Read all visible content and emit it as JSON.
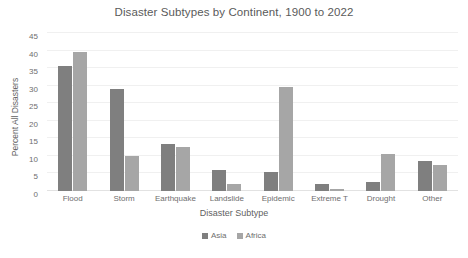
{
  "chart_data": {
    "type": "bar",
    "title": "Disaster Subtypes by Continent, 1900 to 2022",
    "xlabel": "Disaster Subtype",
    "ylabel": "Percent All Disasters",
    "categories": [
      "Flood",
      "Storm",
      "Earthquake",
      "Landslide",
      "Epidemic",
      "Extreme T",
      "Drought",
      "Other"
    ],
    "series": [
      {
        "name": "Asia",
        "color": "#7f7f7f",
        "values": [
          35.5,
          29.0,
          13.5,
          6.0,
          5.5,
          2.0,
          2.5,
          8.5
        ]
      },
      {
        "name": "Africa",
        "color": "#a6a6a6",
        "values": [
          39.5,
          10.0,
          12.5,
          2.0,
          29.5,
          0.5,
          10.5,
          7.5
        ]
      }
    ],
    "ylim": [
      0,
      45
    ],
    "yticks": [
      0,
      5,
      10,
      15,
      20,
      25,
      30,
      35,
      40,
      45
    ],
    "ytick_labels": [
      "0",
      "5",
      "10",
      "15",
      "20",
      "25",
      "30",
      "35",
      "40",
      "45"
    ],
    "grid": true,
    "legend_position": "bottom"
  }
}
